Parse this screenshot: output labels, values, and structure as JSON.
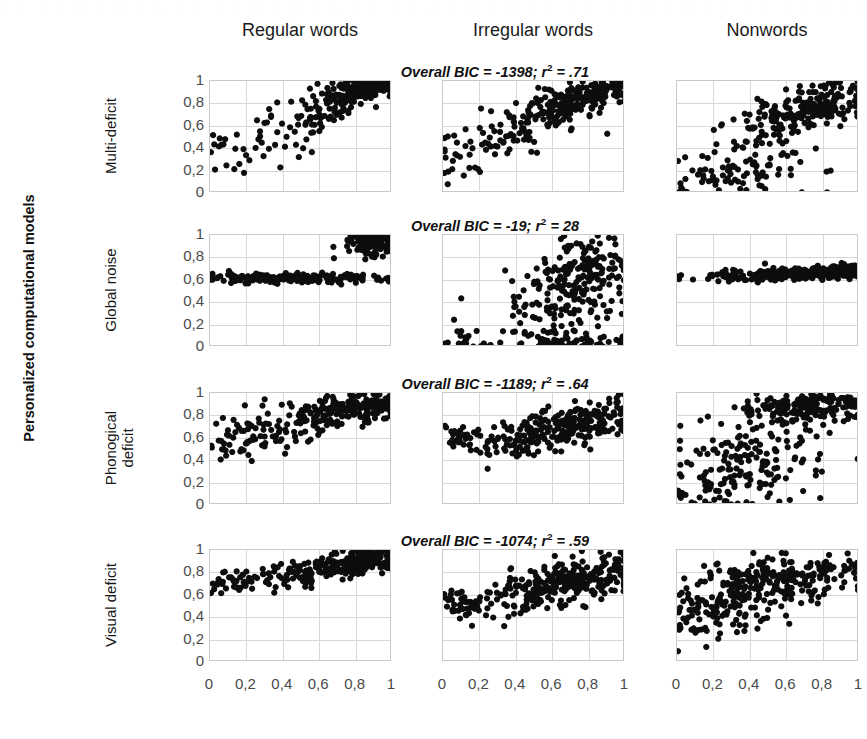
{
  "figure": {
    "ytitle": "Personalized computational models",
    "bleed_text": "· · · · · · · · · · · · · · · · · · · · · · · · · · · · · · · · · · · · · · · · · · · · · · · · · · · · · · · ·"
  },
  "columns": [
    {
      "label": "Regular words"
    },
    {
      "label": "Irregular words"
    },
    {
      "label": "Nonwords"
    }
  ],
  "rows": [
    {
      "label": "Multi-deficit",
      "bic_prefix": "Overall BIC = ",
      "bic_value": "-1398",
      "r2_sep": "; ",
      "r2_label": "r",
      "r2_exp": "2",
      "r2_eq": " = ",
      "r2_value": ".71"
    },
    {
      "label": "Global noise",
      "bic_prefix": "Overall BIC = ",
      "bic_value": "-19",
      "r2_sep": "; ",
      "r2_label": "r",
      "r2_exp": "2",
      "r2_eq": " = ",
      "r2_value": " 28"
    },
    {
      "label": "Phonogical\ndeficit",
      "bic_prefix": "Overall BIC = ",
      "bic_value": "-1189",
      "r2_sep": "; ",
      "r2_label": "r",
      "r2_exp": "2",
      "r2_eq": " = ",
      "r2_value": " .64"
    },
    {
      "label": "Visual deficit",
      "bic_prefix": "Overall BIC = ",
      "bic_value": "-1074",
      "r2_sep": "; ",
      "r2_label": "r",
      "r2_exp": "2",
      "r2_eq": " = ",
      "r2_value": " .59"
    }
  ],
  "axes": {
    "yticks": [
      "1",
      "0,8",
      "0,6",
      "0,4",
      "0,2",
      "0"
    ],
    "xticks": [
      "0",
      "0,2",
      "0,4",
      "0,6",
      "0,8",
      "1"
    ],
    "ylim": [
      0,
      1
    ],
    "xlim": [
      0,
      1
    ],
    "grid": true,
    "grid_color": "#d8d8d8",
    "point_color": "#0d0d0d"
  },
  "chart_data": {
    "type": "scatter",
    "title": "",
    "xlabel": "",
    "ylabel": "Personalized computational models",
    "xlim": [
      0,
      1
    ],
    "ylim": [
      0,
      1
    ],
    "grid": true,
    "legend": "none",
    "row_categories": [
      "Multi-deficit",
      "Global noise",
      "Phonogical deficit",
      "Visual deficit"
    ],
    "col_categories": [
      "Regular words",
      "Irregular words",
      "Nonwords"
    ],
    "annotations": [
      {
        "row": "Multi-deficit",
        "text": "Overall BIC = -1398; r2 = .71",
        "bic": -1398,
        "r2": 0.71
      },
      {
        "row": "Global noise",
        "text": "Overall BIC = -19; r2 = 28",
        "bic": -19,
        "r2": 0.28
      },
      {
        "row": "Phonogical deficit",
        "text": "Overall BIC = -1189; r2 = .64",
        "bic": -1189,
        "r2": 0.64
      },
      {
        "row": "Visual deficit",
        "text": "Overall BIC = -1074; r2 = .59",
        "bic": -1074,
        "r2": 0.59
      }
    ],
    "panels": [
      {
        "row": "Multi-deficit",
        "col": "Regular words",
        "seed": 1101,
        "n": 300,
        "clusters": [
          {
            "w": 0.62,
            "mx": 0.86,
            "my": 0.94,
            "sx": 0.1,
            "sy": 0.055,
            "rho": 0.45
          },
          {
            "w": 0.23,
            "mx": 0.63,
            "my": 0.74,
            "sx": 0.13,
            "sy": 0.11,
            "rho": 0.55
          },
          {
            "w": 0.15,
            "mx": 0.28,
            "my": 0.46,
            "sx": 0.16,
            "sy": 0.16,
            "rho": 0.5
          }
        ]
      },
      {
        "row": "Multi-deficit",
        "col": "Irregular words",
        "seed": 1102,
        "n": 300,
        "clusters": [
          {
            "w": 0.55,
            "mx": 0.8,
            "my": 0.88,
            "sx": 0.12,
            "sy": 0.075,
            "rho": 0.5
          },
          {
            "w": 0.27,
            "mx": 0.55,
            "my": 0.66,
            "sx": 0.14,
            "sy": 0.13,
            "rho": 0.6
          },
          {
            "w": 0.18,
            "mx": 0.22,
            "my": 0.42,
            "sx": 0.13,
            "sy": 0.16,
            "rho": 0.45
          }
        ]
      },
      {
        "row": "Multi-deficit",
        "col": "Nonwords",
        "seed": 1103,
        "n": 310,
        "clusters": [
          {
            "w": 0.47,
            "mx": 0.78,
            "my": 0.8,
            "sx": 0.14,
            "sy": 0.11,
            "rho": 0.4
          },
          {
            "w": 0.28,
            "mx": 0.52,
            "my": 0.58,
            "sx": 0.16,
            "sy": 0.15,
            "rho": 0.45
          },
          {
            "w": 0.25,
            "mx": 0.35,
            "my": 0.2,
            "sx": 0.22,
            "sy": 0.11,
            "rho": 0.2
          }
        ]
      },
      {
        "row": "Global noise",
        "col": "Regular words",
        "seed": 2101,
        "n": 300,
        "clusters": [
          {
            "w": 0.46,
            "mx": 0.9,
            "my": 0.93,
            "sx": 0.075,
            "sy": 0.075,
            "rho": 0.1
          },
          {
            "w": 0.4,
            "mx": 0.58,
            "my": 0.615,
            "sx": 0.2,
            "sy": 0.022,
            "rho": 0.05
          },
          {
            "w": 0.14,
            "mx": 0.16,
            "my": 0.615,
            "sx": 0.09,
            "sy": 0.02,
            "rho": 0.0
          }
        ]
      },
      {
        "row": "Global noise",
        "col": "Irregular words",
        "seed": 2102,
        "n": 320,
        "clusters": [
          {
            "w": 0.52,
            "mx": 0.76,
            "my": 0.66,
            "sx": 0.13,
            "sy": 0.15,
            "rho": 0.25
          },
          {
            "w": 0.26,
            "mx": 0.62,
            "my": 0.32,
            "sx": 0.16,
            "sy": 0.16,
            "rho": 0.2
          },
          {
            "w": 0.15,
            "mx": 0.7,
            "my": 0.05,
            "sx": 0.2,
            "sy": 0.045,
            "rho": 0.1
          },
          {
            "w": 0.07,
            "mx": 0.13,
            "my": 0.06,
            "sx": 0.06,
            "sy": 0.055,
            "rho": 0.0
          }
        ]
      },
      {
        "row": "Global noise",
        "col": "Nonwords",
        "seed": 2103,
        "n": 300,
        "clusters": [
          {
            "w": 0.7,
            "mx": 0.62,
            "my": 0.655,
            "sx": 0.22,
            "sy": 0.03,
            "rho": 0.25
          },
          {
            "w": 0.3,
            "mx": 0.9,
            "my": 0.685,
            "sx": 0.09,
            "sy": 0.028,
            "rho": 0.2
          }
        ]
      },
      {
        "row": "Phonogical deficit",
        "col": "Regular words",
        "seed": 3101,
        "n": 300,
        "clusters": [
          {
            "w": 0.58,
            "mx": 0.8,
            "my": 0.88,
            "sx": 0.13,
            "sy": 0.065,
            "rho": 0.35
          },
          {
            "w": 0.24,
            "mx": 0.5,
            "my": 0.74,
            "sx": 0.13,
            "sy": 0.1,
            "rho": 0.4
          },
          {
            "w": 0.18,
            "mx": 0.17,
            "my": 0.61,
            "sx": 0.1,
            "sy": 0.11,
            "rho": 0.3
          }
        ]
      },
      {
        "row": "Phonogical deficit",
        "col": "Irregular words",
        "seed": 3102,
        "n": 300,
        "clusters": [
          {
            "w": 0.62,
            "mx": 0.72,
            "my": 0.72,
            "sx": 0.15,
            "sy": 0.1,
            "rho": 0.45
          },
          {
            "w": 0.24,
            "mx": 0.4,
            "my": 0.58,
            "sx": 0.13,
            "sy": 0.11,
            "rho": 0.4
          },
          {
            "w": 0.14,
            "mx": 0.1,
            "my": 0.6,
            "sx": 0.05,
            "sy": 0.055,
            "rho": 0.0
          }
        ]
      },
      {
        "row": "Phonogical deficit",
        "col": "Nonwords",
        "seed": 3103,
        "n": 340,
        "clusters": [
          {
            "w": 0.42,
            "mx": 0.7,
            "my": 0.87,
            "sx": 0.2,
            "sy": 0.065,
            "rho": 0.25
          },
          {
            "w": 0.33,
            "mx": 0.42,
            "my": 0.5,
            "sx": 0.22,
            "sy": 0.17,
            "rho": 0.2
          },
          {
            "w": 0.25,
            "mx": 0.35,
            "my": 0.17,
            "sx": 0.22,
            "sy": 0.12,
            "rho": 0.15
          }
        ]
      },
      {
        "row": "Visual deficit",
        "col": "Regular words",
        "seed": 4101,
        "n": 300,
        "clusters": [
          {
            "w": 0.6,
            "mx": 0.82,
            "my": 0.89,
            "sx": 0.12,
            "sy": 0.055,
            "rho": 0.35
          },
          {
            "w": 0.25,
            "mx": 0.5,
            "my": 0.79,
            "sx": 0.13,
            "sy": 0.075,
            "rho": 0.3
          },
          {
            "w": 0.15,
            "mx": 0.14,
            "my": 0.705,
            "sx": 0.08,
            "sy": 0.045,
            "rho": 0.15
          }
        ]
      },
      {
        "row": "Visual deficit",
        "col": "Irregular words",
        "seed": 4102,
        "n": 310,
        "clusters": [
          {
            "w": 0.6,
            "mx": 0.72,
            "my": 0.72,
            "sx": 0.16,
            "sy": 0.105,
            "rho": 0.4
          },
          {
            "w": 0.26,
            "mx": 0.44,
            "my": 0.58,
            "sx": 0.14,
            "sy": 0.12,
            "rho": 0.35
          },
          {
            "w": 0.14,
            "mx": 0.09,
            "my": 0.52,
            "sx": 0.05,
            "sy": 0.075,
            "rho": 0.0
          }
        ]
      },
      {
        "row": "Visual deficit",
        "col": "Nonwords",
        "seed": 4103,
        "n": 330,
        "clusters": [
          {
            "w": 0.5,
            "mx": 0.62,
            "my": 0.77,
            "sx": 0.22,
            "sy": 0.085,
            "rho": 0.35
          },
          {
            "w": 0.33,
            "mx": 0.36,
            "my": 0.58,
            "sx": 0.2,
            "sy": 0.13,
            "rho": 0.3
          },
          {
            "w": 0.17,
            "mx": 0.25,
            "my": 0.38,
            "sx": 0.18,
            "sy": 0.11,
            "rho": 0.2
          }
        ]
      }
    ]
  }
}
